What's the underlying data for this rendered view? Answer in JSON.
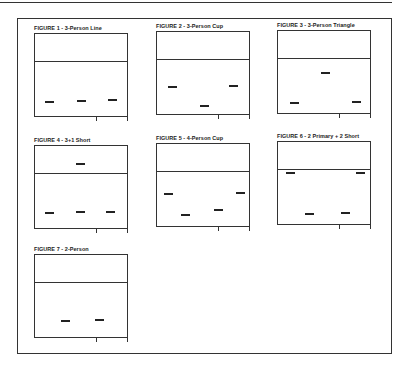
{
  "page": {
    "figures": [
      {
        "id": 1,
        "title": "FIGURE 1 - 3-Person Line",
        "x": 34,
        "y": 25,
        "marks": [
          {
            "x": 10,
            "y": 67
          },
          {
            "x": 42,
            "y": 66
          },
          {
            "x": 73,
            "y": 65
          }
        ]
      },
      {
        "id": 2,
        "title": "FIGURE 2 - 3-Person Cup",
        "x": 156,
        "y": 23,
        "marks": [
          {
            "x": 11,
            "y": 54
          },
          {
            "x": 43,
            "y": 73
          },
          {
            "x": 72,
            "y": 53
          }
        ]
      },
      {
        "id": 3,
        "title": "FIGURE 3 - 3-Person Triangle",
        "x": 277,
        "y": 22,
        "marks": [
          {
            "x": 12,
            "y": 71
          },
          {
            "x": 43,
            "y": 41
          },
          {
            "x": 74,
            "y": 70
          }
        ]
      },
      {
        "id": 4,
        "title": "FIGURE 4 - 3+1 Short",
        "x": 34,
        "y": 137,
        "marks": [
          {
            "x": 10,
            "y": 66
          },
          {
            "x": 41,
            "y": 17
          },
          {
            "x": 41,
            "y": 65
          },
          {
            "x": 71,
            "y": 65
          }
        ]
      },
      {
        "id": 5,
        "title": "FIGURE 5 - 4-Person Cup",
        "x": 156,
        "y": 135,
        "marks": [
          {
            "x": 7,
            "y": 49
          },
          {
            "x": 24,
            "y": 70
          },
          {
            "x": 57,
            "y": 65
          },
          {
            "x": 79,
            "y": 48
          }
        ]
      },
      {
        "id": 6,
        "title": "FIGURE 6 - 2 Primary + 2 Short",
        "x": 277,
        "y": 133,
        "marks": [
          {
            "x": 8,
            "y": 30
          },
          {
            "x": 27,
            "y": 71
          },
          {
            "x": 63,
            "y": 70
          },
          {
            "x": 78,
            "y": 30
          }
        ]
      },
      {
        "id": 7,
        "title": "FIGURE 7 - 2-Person",
        "x": 34,
        "y": 246,
        "marks": [
          {
            "x": 26,
            "y": 65
          },
          {
            "x": 60,
            "y": 64
          }
        ]
      }
    ]
  },
  "colors": {
    "ink": "#222222",
    "background": "#ffffff"
  }
}
